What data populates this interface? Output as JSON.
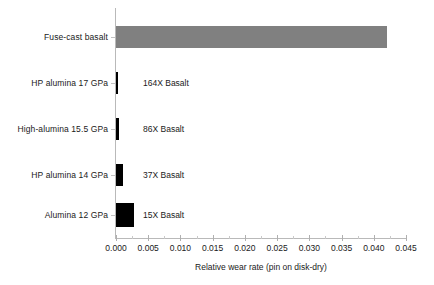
{
  "chart_data": {
    "type": "bar",
    "orientation": "horizontal",
    "title": "",
    "xlabel": "Relative wear rate (pin on disk-dry)",
    "ylabel": "",
    "categories": [
      "Fuse-cast basalt",
      "HP alumina 17 GPa",
      "High-alumina 15.5 GPa",
      "HP alumina 14 GPa",
      "Alumina 12 GPa"
    ],
    "values": [
      0.042,
      0.00026,
      0.00049,
      0.00114,
      0.0028
    ],
    "annotations": [
      "",
      "164X Basalt",
      "86X Basalt",
      "37X Basalt",
      "15X Basalt"
    ],
    "bar_colors": [
      "#808080",
      "#000000",
      "#000000",
      "#000000",
      "#000000"
    ],
    "xlim": [
      0.0,
      0.045
    ],
    "xticks": [
      "0.000",
      "0.005",
      "0.010",
      "0.015",
      "0.020",
      "0.025",
      "0.030",
      "0.035",
      "0.040",
      "0.045"
    ],
    "xtick_values": [
      0.0,
      0.005,
      0.01,
      0.015,
      0.02,
      0.025,
      0.03,
      0.035,
      0.04,
      0.045
    ],
    "minor_ticks": true,
    "grid": false,
    "legend": false
  },
  "axis": {
    "x_title": "Relative wear rate (pin on disk-dry)"
  },
  "rows": [
    {
      "label": "Fuse-cast basalt",
      "annot": "",
      "value": 0.042
    },
    {
      "label": "HP alumina 17 GPa",
      "annot": "164X Basalt",
      "value": 0.00026
    },
    {
      "label": "High-alumina 15.5 GPa",
      "annot": "86X Basalt",
      "value": 0.00049
    },
    {
      "label": "HP alumina 14 GPa",
      "annot": "37X Basalt",
      "value": 0.00114
    },
    {
      "label": "Alumina 12 GPa",
      "annot": "15X Basalt",
      "value": 0.0028
    }
  ],
  "ticklabels": {
    "t0": "0.000",
    "t1": "0.005",
    "t2": "0.010",
    "t3": "0.015",
    "t4": "0.020",
    "t5": "0.025",
    "t6": "0.030",
    "t7": "0.035",
    "t8": "0.040",
    "t9": "0.045"
  }
}
